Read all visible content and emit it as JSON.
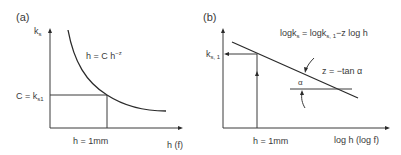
{
  "panel_a": {
    "label": "(a)",
    "y_axis_label": {
      "main": "k",
      "sub": "s"
    },
    "x_axis_label": "h (f)",
    "curve_formula": {
      "main": "h = C h",
      "sup": "−z"
    },
    "y_marker_label": {
      "main": "C = k",
      "sub": "s1"
    },
    "x_marker_label": "h = 1mm"
  },
  "panel_b": {
    "label": "(b)",
    "y_marker_label": {
      "main": "k",
      "sub": "s, 1"
    },
    "x_axis_label": "log h (log f)",
    "line_formula": {
      "p1": "logk",
      "s1": "s",
      "p2": " = logk",
      "s2": "s, 1",
      "p3": "−z log h"
    },
    "slope_formula": "z = −tan α",
    "angle_label": "α",
    "x_marker_label": "h = 1mm"
  }
}
